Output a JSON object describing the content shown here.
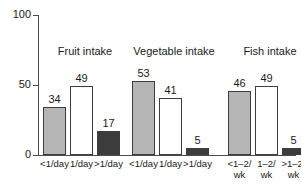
{
  "chart_data": {
    "type": "bar",
    "title": "",
    "xlabel": "",
    "ylabel": "",
    "ylim": [
      0,
      100
    ],
    "yticks": [
      "0",
      "50",
      "100"
    ],
    "grid": false,
    "legend": "none",
    "groups": [
      {
        "title": "Fruit intake",
        "categories": [
          "<1/day",
          "1/day",
          ">1/day"
        ],
        "values": [
          34,
          49,
          17
        ],
        "fills": [
          "gray",
          "white",
          "dark"
        ]
      },
      {
        "title": "Vegetable intake",
        "categories": [
          "<1/day",
          "1/day",
          ">1/day"
        ],
        "values": [
          53,
          41,
          5
        ],
        "fills": [
          "gray",
          "white",
          "dark"
        ]
      },
      {
        "title": "Fish intake",
        "categories": [
          "<1–2/",
          "1–2/",
          ">1–2/"
        ],
        "categories_line2": [
          "wk",
          "wk",
          "wk"
        ],
        "values": [
          46,
          49,
          5
        ],
        "fills": [
          "gray",
          "white",
          "dark"
        ]
      }
    ],
    "colors": {
      "bar_gray": "#b5b5b5",
      "bar_white": "#ffffff",
      "bar_dark": "#3c3c3c",
      "axis": "#4d4d4d",
      "text": "#1a1a1a"
    }
  }
}
